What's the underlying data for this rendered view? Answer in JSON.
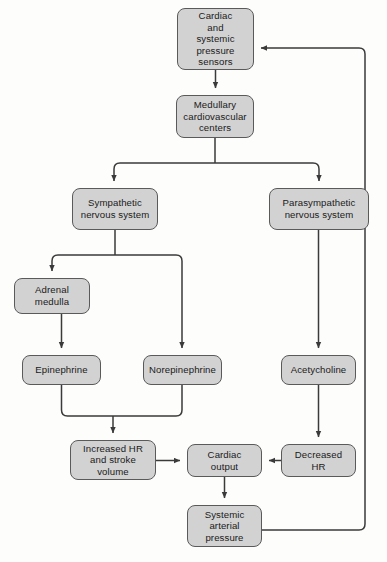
{
  "diagram": {
    "background_color": "#fdfdfc",
    "node_fill_color": "#d2d2d2",
    "node_border_color": "#5a5a5a",
    "edge_color": "#3a3a3a",
    "text_color": "#1a1a1a",
    "nodes": [
      {
        "id": "sensors",
        "label": "Cardiac\nand\nsystemic\npressure\nsensors",
        "x": 177,
        "y": 8,
        "w": 77,
        "h": 62
      },
      {
        "id": "medullary",
        "label": "Medullary\ncardiovascular\ncenters",
        "x": 176,
        "y": 95,
        "w": 78,
        "h": 43
      },
      {
        "id": "sympathetic",
        "label": "Sympathetic\nnervous system",
        "x": 72,
        "y": 188,
        "w": 86,
        "h": 42
      },
      {
        "id": "parasympathetic",
        "label": "Parasympathetic\nnervous system",
        "x": 269,
        "y": 188,
        "w": 100,
        "h": 42
      },
      {
        "id": "adrenal",
        "label": "Adrenal\nmedulla",
        "x": 14,
        "y": 278,
        "w": 76,
        "h": 36
      },
      {
        "id": "epinephrine",
        "label": "Epinephrine",
        "x": 22,
        "y": 355,
        "w": 79,
        "h": 30
      },
      {
        "id": "norepinephrine",
        "label": "Norepinephrine",
        "x": 143,
        "y": 355,
        "w": 79,
        "h": 30
      },
      {
        "id": "acetycholine",
        "label": "Acetycholine",
        "x": 281,
        "y": 355,
        "w": 75,
        "h": 30
      },
      {
        "id": "increased-hr",
        "label": "Increased HR\nand stroke\nvolume",
        "x": 70,
        "y": 440,
        "w": 86,
        "h": 40
      },
      {
        "id": "cardiac-output",
        "label": "Cardiac\noutput",
        "x": 187,
        "y": 444,
        "w": 75,
        "h": 33
      },
      {
        "id": "decreased-hr",
        "label": "Decreased\nHR",
        "x": 281,
        "y": 444,
        "w": 75,
        "h": 33
      },
      {
        "id": "systemic-pressure",
        "label": "Systemic\narterial\npressure",
        "x": 187,
        "y": 505,
        "w": 75,
        "h": 42
      }
    ],
    "edges": [
      {
        "id": "sensors-to-medullary",
        "from": "sensors",
        "to": "medullary",
        "kind": "arrow-down"
      },
      {
        "id": "medullary-to-sympathetic",
        "from": "medullary",
        "to": "sympathetic",
        "kind": "branch-left"
      },
      {
        "id": "medullary-to-parasympathetic",
        "from": "medullary",
        "to": "parasympathetic",
        "kind": "branch-right"
      },
      {
        "id": "sympathetic-to-adrenal",
        "from": "sympathetic",
        "to": "adrenal",
        "kind": "branch-left"
      },
      {
        "id": "sympathetic-to-norepinephrine",
        "from": "sympathetic",
        "to": "norepinephrine",
        "kind": "branch-right"
      },
      {
        "id": "adrenal-to-epinephrine",
        "from": "adrenal",
        "to": "epinephrine",
        "kind": "arrow-down"
      },
      {
        "id": "parasympathetic-to-acetycholine",
        "from": "parasympathetic",
        "to": "acetycholine",
        "kind": "arrow-down"
      },
      {
        "id": "epinephrine-to-increased-hr",
        "from": "epinephrine",
        "to": "increased-hr",
        "kind": "merge-down"
      },
      {
        "id": "norepinephrine-to-increased-hr",
        "from": "norepinephrine",
        "to": "increased-hr",
        "kind": "merge-down"
      },
      {
        "id": "acetycholine-to-decreased-hr",
        "from": "acetycholine",
        "to": "decreased-hr",
        "kind": "arrow-down"
      },
      {
        "id": "increased-hr-to-cardiac-output",
        "from": "increased-hr",
        "to": "cardiac-output",
        "kind": "arrow-right"
      },
      {
        "id": "decreased-hr-to-cardiac-output",
        "from": "decreased-hr",
        "to": "cardiac-output",
        "kind": "arrow-left"
      },
      {
        "id": "cardiac-output-to-systemic-pressure",
        "from": "cardiac-output",
        "to": "systemic-pressure",
        "kind": "arrow-down"
      },
      {
        "id": "systemic-pressure-feedback-to-sensors",
        "from": "systemic-pressure",
        "to": "sensors",
        "kind": "feedback-loop"
      }
    ]
  }
}
